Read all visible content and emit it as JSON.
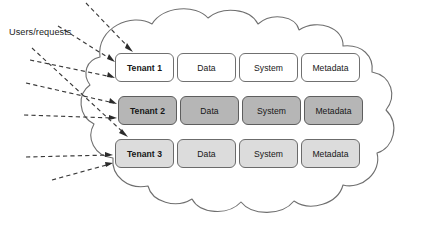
{
  "diagram": {
    "source_label": "Users/requests",
    "container": {
      "shape_name": "cloud",
      "fill": "#ffffff",
      "stroke": "#6f6f6f"
    },
    "columns": [
      "Tenant",
      "Data",
      "System",
      "Metadata"
    ],
    "rows": [
      {
        "name": "Tenant 1",
        "data": "Data",
        "system": "System",
        "metadata": "Metadata",
        "fill": "#ffffff",
        "shade": "white"
      },
      {
        "name": "Tenant 2",
        "data": "Data",
        "system": "System",
        "metadata": "Metadata",
        "fill": "#b6b6b6",
        "shade": "dark-gray"
      },
      {
        "name": "Tenant 3",
        "data": "Data",
        "system": "System",
        "metadata": "Metadata",
        "fill": "#dcdcdc",
        "shade": "light-gray"
      }
    ],
    "connectors": {
      "style": "dashed",
      "color": "#3a3a3a",
      "count": 6,
      "direction": "users-to-tenants"
    }
  }
}
